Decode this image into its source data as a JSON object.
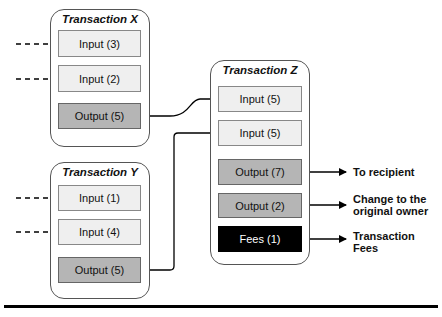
{
  "transactions": {
    "x": {
      "title": "Transaction X",
      "inputs": [
        "Input (3)",
        "Input (2)"
      ],
      "output": "Output (5)"
    },
    "y": {
      "title": "Transaction Y",
      "inputs": [
        "Input (1)",
        "Input (4)"
      ],
      "output": "Output (5)"
    },
    "z": {
      "title": "Transaction Z",
      "inputs": [
        "Input (5)",
        "Input (5)"
      ],
      "outputs": [
        "Output (7)",
        "Output (2)"
      ],
      "fees": "Fees (1)"
    }
  },
  "labels": {
    "to_recipient": "To recipient",
    "change_line1": "Change to the",
    "change_line2": "original owner",
    "fees_line1": "Transaction",
    "fees_line2": "Fees"
  },
  "colors": {
    "input_fill": "#efefef",
    "output_fill": "#b5b5b5",
    "fees_fill": "#000000"
  }
}
